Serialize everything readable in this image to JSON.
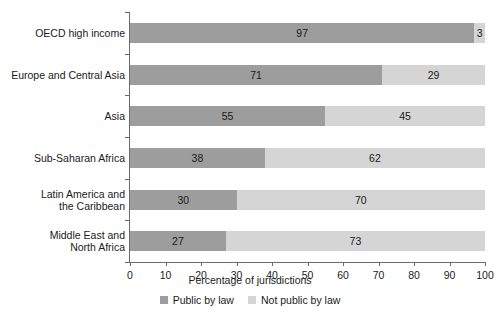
{
  "chart_data": {
    "type": "bar",
    "orientation": "horizontal",
    "stacked": true,
    "title": "",
    "xlabel": "Percentage of jurisdictions",
    "ylabel": "",
    "xlim": [
      0,
      100
    ],
    "xticks": [
      0,
      10,
      20,
      30,
      40,
      50,
      60,
      70,
      80,
      90,
      100
    ],
    "grid": false,
    "legend_position": "bottom-center",
    "categories": [
      "OECD high income",
      "Europe and Central Asia",
      "Asia",
      "Sub-Saharan Africa",
      "Latin America and\nthe Caribbean",
      "Middle East and\nNorth Africa"
    ],
    "series": [
      {
        "name": "Public by law",
        "color": "#9d9d9d",
        "values": [
          97,
          71,
          55,
          38,
          30,
          27
        ]
      },
      {
        "name": "Not public by law",
        "color": "#d5d5d5",
        "values": [
          3,
          29,
          45,
          62,
          70,
          73
        ]
      }
    ]
  },
  "axis": {
    "x_title": "Percentage of jurisdictions"
  },
  "legend": {
    "items": [
      {
        "label": "Public by law",
        "color": "#9d9d9d"
      },
      {
        "label": "Not public by law",
        "color": "#d5d5d5"
      }
    ]
  }
}
